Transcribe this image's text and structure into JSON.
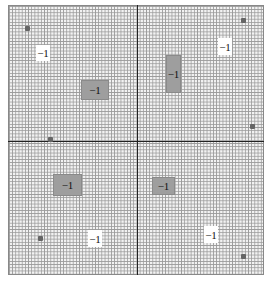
{
  "figure": {
    "grid": {
      "left": 8,
      "top": 5,
      "width": 256,
      "height": 270,
      "color": "#9a9a9a",
      "background": "#f2f2f2"
    },
    "axes": {
      "vertical_x": 137,
      "horizontal_y": 141,
      "color": "#222222"
    },
    "boxes": [
      {
        "label": "−1",
        "style": "white",
        "x": 36,
        "y": 45,
        "w": 14,
        "h": 16
      },
      {
        "label": "−1",
        "style": "gray",
        "x": 81,
        "y": 80,
        "w": 26,
        "h": 18
      },
      {
        "label": "−1",
        "style": "gray",
        "x": 166,
        "y": 55,
        "w": 13,
        "h": 36
      },
      {
        "label": "−1",
        "style": "white",
        "x": 218,
        "y": 38,
        "w": 14,
        "h": 17
      },
      {
        "label": "−1",
        "style": "gray",
        "x": 53,
        "y": 174,
        "w": 27,
        "h": 20
      },
      {
        "label": "−1",
        "style": "gray",
        "x": 152,
        "y": 177,
        "w": 21,
        "h": 16
      },
      {
        "label": "−1",
        "style": "white",
        "x": 88,
        "y": 230,
        "w": 14,
        "h": 17
      },
      {
        "label": "−1",
        "style": "white",
        "x": 204,
        "y": 226,
        "w": 14,
        "h": 17
      }
    ],
    "dots": [
      {
        "x": 25,
        "y": 26
      },
      {
        "x": 241,
        "y": 18
      },
      {
        "x": 250,
        "y": 124
      },
      {
        "x": 48,
        "y": 137
      },
      {
        "x": 38,
        "y": 236
      },
      {
        "x": 241,
        "y": 254
      }
    ]
  }
}
